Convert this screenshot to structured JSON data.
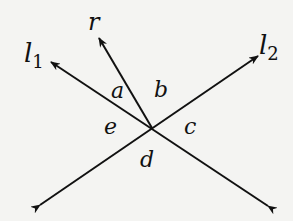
{
  "diagram": {
    "lines": [
      {
        "id": "l1",
        "label": "l",
        "subscript": "1"
      },
      {
        "id": "l2",
        "label": "l",
        "subscript": "2"
      }
    ],
    "ray": {
      "id": "r",
      "label": "r"
    },
    "angles": [
      {
        "id": "a",
        "label": "a"
      },
      {
        "id": "b",
        "label": "b"
      },
      {
        "id": "c",
        "label": "c"
      },
      {
        "id": "d",
        "label": "d"
      },
      {
        "id": "e",
        "label": "e"
      }
    ],
    "colors": {
      "stroke": "#111111",
      "background": "#f4f4f2"
    }
  }
}
